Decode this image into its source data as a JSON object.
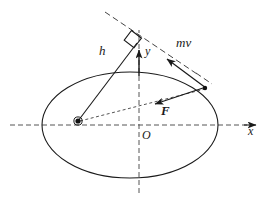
{
  "figure": {
    "background_color": "#ffffff",
    "stroke_color": "#1a1a1a",
    "dash_color": "#555555"
  },
  "labels": {
    "h": "h",
    "y": "y",
    "mv": "mv",
    "F": "F",
    "origin": "O",
    "x_axis": "x"
  },
  "geometry": {
    "ellipse": {
      "center_x": 130,
      "center_y": 125,
      "radius_x": 88,
      "radius_y": 53
    },
    "focus_point": {
      "x": 78,
      "y": 121
    },
    "particle_point": {
      "x": 205,
      "y": 88
    },
    "perpendicular_foot": {
      "x": 139,
      "y": 41
    },
    "origin_point": {
      "x": 139,
      "y": 125
    },
    "x_axis": {
      "x1": 10,
      "y1": 125,
      "x2": 258,
      "y2": 125
    },
    "y_axis": {
      "x1": 139,
      "y1": 190,
      "x2": 139,
      "y2": 20
    },
    "tangent_line": {
      "x1": 105,
      "y1": 12,
      "x2": 214,
      "y2": 85
    },
    "y_arrow": {
      "x1": 139,
      "y1": 76,
      "x2": 139,
      "y2": 47
    },
    "force_arrow": {
      "x1": 205,
      "y1": 88,
      "x2": 152,
      "y2": 105
    },
    "momentum_arrow": {
      "x1": 205,
      "y1": 88,
      "x2": 163,
      "y2": 56
    },
    "h_line": {
      "x1": 78,
      "y1": 121,
      "x2": 139,
      "y2": 41
    },
    "radius_line": {
      "x1": 78,
      "y1": 121,
      "x2": 205,
      "y2": 88
    },
    "right_angle_marker": {
      "x": 130,
      "y": 33,
      "size": 11
    }
  },
  "elements": {
    "ellipse_name": "orbit-ellipse",
    "focus_name": "focus-marker",
    "particle_name": "particle-marker"
  }
}
